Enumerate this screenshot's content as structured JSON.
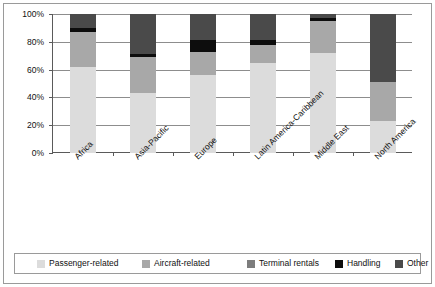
{
  "chart_data": {
    "type": "bar",
    "subtype": "stacked-100-percent",
    "title": "",
    "xlabel": "",
    "ylabel": "",
    "ylim": [
      0,
      100
    ],
    "yticks": [
      "0%",
      "20%",
      "40%",
      "60%",
      "80%",
      "100%"
    ],
    "ytick_values": [
      0,
      20,
      40,
      60,
      80,
      100
    ],
    "grid": "horizontal",
    "legend_position": "bottom",
    "categories": [
      "Africa",
      "Asia-Pacific",
      "Europe",
      "Latin America-Caribbean",
      "Middle East",
      "North America"
    ],
    "series": [
      {
        "name": "Passenger-related",
        "color": "#dcdcdc",
        "values": [
          62,
          43,
          56,
          65,
          72,
          23
        ]
      },
      {
        "name": "Aircraft-related",
        "color": "#a8a8a8",
        "values": [
          25,
          26,
          17,
          13,
          23,
          28
        ]
      },
      {
        "name": "Terminal rentals",
        "color": "#7d7d7d",
        "values": [
          0,
          0,
          0,
          0,
          0,
          0
        ]
      },
      {
        "name": "Handling",
        "color": "#0d0d0d",
        "values": [
          3,
          2,
          8,
          3,
          2,
          0
        ]
      },
      {
        "name": "Other",
        "color": "#4a4a4a",
        "values": [
          10,
          29,
          19,
          19,
          3,
          49
        ]
      }
    ]
  },
  "legend": {
    "items": [
      {
        "label": "Passenger-related",
        "color": "#dcdcdc"
      },
      {
        "label": "Aircraft-related",
        "color": "#a8a8a8"
      },
      {
        "label": "Terminal rentals",
        "color": "#7d7d7d"
      },
      {
        "label": "Handling",
        "color": "#0d0d0d"
      },
      {
        "label": "Other",
        "color": "#4a4a4a"
      }
    ]
  }
}
